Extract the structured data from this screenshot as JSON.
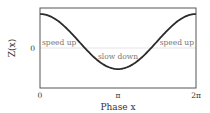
{
  "chart_data": {
    "type": "line",
    "title": "",
    "xlabel": "Phase x",
    "ylabel": "Z(x)",
    "xticks": [
      "0",
      "π",
      "2π"
    ],
    "yticks": [
      "0"
    ],
    "xlim": [
      0,
      6.2832
    ],
    "ylim": [
      -1.0,
      1.15
    ],
    "grid": false,
    "zero_line": true,
    "series": [
      {
        "name": "Z(x)",
        "x": [
          0,
          0.7854,
          1.5708,
          2.3562,
          3.1416,
          3.927,
          4.7124,
          5.4978,
          6.2832
        ],
        "y": [
          1.0,
          0.76,
          0.19,
          -0.38,
          -0.62,
          -0.38,
          0.19,
          0.76,
          1.0
        ]
      }
    ],
    "annotations": [
      {
        "text": "speed up",
        "x": 0.55,
        "y": 0.12
      },
      {
        "text": "slow down",
        "x": 3.14,
        "y": -0.28
      },
      {
        "text": "speed up",
        "x": 5.8,
        "y": 0.12
      }
    ]
  },
  "labels": {
    "ylabel": "Z(x)",
    "xlabel": "Phase x",
    "xtick0": "0",
    "xtick1": "π",
    "xtick2": "2π",
    "ytick0": "0",
    "ann_left": "speed up",
    "ann_mid": "slow down",
    "ann_right": "speed up"
  },
  "colors": {
    "curve": "#2b2b2b",
    "frame": "#555555",
    "zero_line": "#dddddd",
    "annotation": "#777777"
  }
}
